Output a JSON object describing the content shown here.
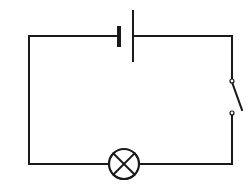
{
  "diagram": {
    "type": "circuit",
    "components": [
      {
        "name": "battery",
        "kind": "cell",
        "position": "top"
      },
      {
        "name": "switch",
        "kind": "switch",
        "state": "open",
        "position": "right"
      },
      {
        "name": "lamp",
        "kind": "bulb",
        "position": "bottom"
      }
    ],
    "colors": {
      "line": "#1a1a1a",
      "background": "#ffffff"
    }
  }
}
